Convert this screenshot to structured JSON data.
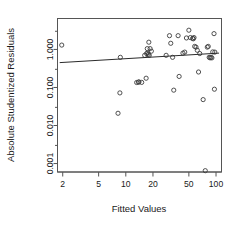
{
  "chart_data": {
    "type": "scatter",
    "title": "",
    "xlabel": "Fitted Values",
    "ylabel": "Absolute Studentized Residuals",
    "xscale": "log",
    "yscale": "log",
    "grid": false,
    "legend": null,
    "xlim": [
      1.75,
      115
    ],
    "ylim": [
      0.0006,
      6.5
    ],
    "xticks": [
      2,
      5,
      10,
      20,
      50,
      100
    ],
    "xticklabels": [
      "2",
      "5",
      "10",
      "20",
      "50",
      "100"
    ],
    "yticks": [
      1.0,
      0.1,
      0.01,
      0.001
    ],
    "yticklabels": [
      "1.000",
      "0.100",
      "0.010",
      "0.001"
    ],
    "marker": "open-circle",
    "marker_color": "#3d3d3d",
    "points": [
      {
        "x": 1.95,
        "y": 1.3
      },
      {
        "x": 8.7,
        "y": 0.62
      },
      {
        "x": 8.6,
        "y": 0.072
      },
      {
        "x": 8.2,
        "y": 0.021
      },
      {
        "x": 13.2,
        "y": 0.135
      },
      {
        "x": 13.8,
        "y": 0.138
      },
      {
        "x": 14.0,
        "y": 0.14
      },
      {
        "x": 15.0,
        "y": 0.136
      },
      {
        "x": 16.8,
        "y": 0.175
      },
      {
        "x": 16.2,
        "y": 0.7
      },
      {
        "x": 17.0,
        "y": 0.78
      },
      {
        "x": 17.5,
        "y": 0.8
      },
      {
        "x": 17.3,
        "y": 1.05
      },
      {
        "x": 18.0,
        "y": 1.55
      },
      {
        "x": 18.6,
        "y": 1.05
      },
      {
        "x": 19.2,
        "y": 0.9
      },
      {
        "x": 17.8,
        "y": 0.74
      },
      {
        "x": 18.2,
        "y": 0.7
      },
      {
        "x": 28.0,
        "y": 0.7
      },
      {
        "x": 30.5,
        "y": 2.3
      },
      {
        "x": 31.5,
        "y": 1.45
      },
      {
        "x": 33.0,
        "y": 0.62
      },
      {
        "x": 34.0,
        "y": 0.085
      },
      {
        "x": 38.0,
        "y": 2.3
      },
      {
        "x": 39.0,
        "y": 0.195
      },
      {
        "x": 43.0,
        "y": 0.8
      },
      {
        "x": 45.0,
        "y": 0.85
      },
      {
        "x": 47.0,
        "y": 2.0
      },
      {
        "x": 50.0,
        "y": 3.2
      },
      {
        "x": 52.0,
        "y": 2.05
      },
      {
        "x": 55.0,
        "y": 1.95
      },
      {
        "x": 56.0,
        "y": 1.9
      },
      {
        "x": 57.0,
        "y": 2.05
      },
      {
        "x": 58.0,
        "y": 1.2
      },
      {
        "x": 60.0,
        "y": 1.15
      },
      {
        "x": 62.0,
        "y": 0.95
      },
      {
        "x": 64.0,
        "y": 0.255
      },
      {
        "x": 66.0,
        "y": 0.78
      },
      {
        "x": 72.0,
        "y": 0.048
      },
      {
        "x": 76.0,
        "y": 0.00065
      },
      {
        "x": 80.0,
        "y": 1.15
      },
      {
        "x": 82.0,
        "y": 1.2
      },
      {
        "x": 84.0,
        "y": 0.62
      },
      {
        "x": 86.0,
        "y": 0.6
      },
      {
        "x": 88.0,
        "y": 0.62
      },
      {
        "x": 90.0,
        "y": 0.6
      },
      {
        "x": 92.0,
        "y": 0.86
      },
      {
        "x": 95.0,
        "y": 2.6
      },
      {
        "x": 96.0,
        "y": 0.09
      },
      {
        "x": 97.0,
        "y": 0.85
      }
    ],
    "trend_line": {
      "type": "smoother",
      "x_start": 1.85,
      "y_start": 0.45,
      "x_end": 108,
      "y_end": 0.8,
      "color": "#2b2b2b"
    }
  }
}
